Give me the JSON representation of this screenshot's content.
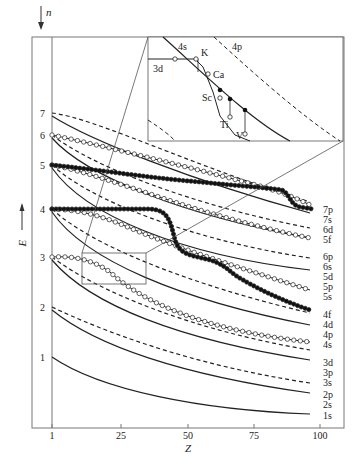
{
  "chart_data": {
    "type": "line",
    "title": "",
    "xlabel": "Z",
    "ylabel": "E",
    "top_axis_label": "n",
    "xlim": [
      1,
      100
    ],
    "x_ticks": [
      1,
      25,
      50,
      75,
      100
    ],
    "x_tick_labels": [
      "1",
      "25",
      "50",
      "75",
      "100"
    ],
    "y_level_labels": [
      "1",
      "2",
      "3",
      "4",
      "5",
      "6",
      "7"
    ],
    "grid": false,
    "legend_position": "right-end labels",
    "series": [
      {
        "name": "1s",
        "style": "solid",
        "x": [
          1,
          25,
          50,
          75,
          100
        ],
        "y": [
          1.0,
          0.62,
          0.42,
          0.3,
          0.24
        ]
      },
      {
        "name": "2s",
        "style": "solid",
        "x": [
          1,
          25,
          50,
          75,
          100
        ],
        "y": [
          2.0,
          1.45,
          1.08,
          0.85,
          0.7
        ]
      },
      {
        "name": "2p",
        "style": "dashed",
        "x": [
          1,
          25,
          50,
          75,
          100
        ],
        "y": [
          2.0,
          1.55,
          1.18,
          0.95,
          0.8
        ]
      },
      {
        "name": "3s",
        "style": "solid",
        "x": [
          1,
          25,
          50,
          75,
          100
        ],
        "y": [
          3.0,
          2.15,
          1.65,
          1.33,
          1.12
        ]
      },
      {
        "name": "3p",
        "style": "dashed",
        "x": [
          1,
          25,
          50,
          75,
          100
        ],
        "y": [
          3.0,
          2.25,
          1.78,
          1.46,
          1.25
        ]
      },
      {
        "name": "3d",
        "style": "open-circles",
        "x": [
          1,
          10,
          20,
          30,
          40,
          50,
          60,
          70,
          80,
          90,
          100
        ],
        "y": [
          3.0,
          3.0,
          2.8,
          2.35,
          2.05,
          1.88,
          1.74,
          1.62,
          1.52,
          1.44,
          1.37
        ]
      },
      {
        "name": "4s",
        "style": "solid",
        "x": [
          1,
          25,
          50,
          75,
          100
        ],
        "y": [
          4.0,
          2.85,
          2.3,
          1.95,
          1.72
        ]
      },
      {
        "name": "4p",
        "style": "dashed",
        "x": [
          1,
          25,
          50,
          75,
          100
        ],
        "y": [
          4.0,
          3.0,
          2.45,
          2.1,
          1.86
        ]
      },
      {
        "name": "4d",
        "style": "open-circles",
        "x": [
          1,
          10,
          25,
          40,
          50,
          60,
          70,
          80,
          90,
          100
        ],
        "y": [
          4.0,
          3.98,
          3.65,
          3.3,
          3.1,
          2.9,
          2.72,
          2.55,
          2.4,
          2.0
        ]
      },
      {
        "name": "4f",
        "style": "filled-circles",
        "x": [
          1,
          20,
          40,
          55,
          57,
          60,
          70,
          80,
          90,
          100
        ],
        "y": [
          4.0,
          4.0,
          4.0,
          3.95,
          3.5,
          3.1,
          2.95,
          2.55,
          2.2,
          1.98
        ]
      },
      {
        "name": "5s",
        "style": "solid",
        "x": [
          1,
          25,
          50,
          75,
          100
        ],
        "y": [
          5.0,
          3.75,
          3.1,
          2.75,
          2.52
        ]
      },
      {
        "name": "5p",
        "style": "dashed",
        "x": [
          1,
          25,
          50,
          75,
          100
        ],
        "y": [
          5.0,
          3.9,
          3.25,
          2.9,
          2.68
        ]
      },
      {
        "name": "5d",
        "style": "open-circles",
        "x": [
          1,
          20,
          40,
          60,
          80,
          100
        ],
        "y": [
          5.0,
          4.6,
          4.1,
          3.6,
          3.25,
          2.78
        ]
      },
      {
        "name": "5f",
        "style": "filled-circles",
        "x": [
          1,
          20,
          40,
          60,
          75,
          85,
          90,
          95,
          100
        ],
        "y": [
          5.0,
          4.9,
          4.7,
          4.45,
          4.3,
          4.15,
          3.7,
          3.35,
          3.3
        ]
      },
      {
        "name": "6s",
        "style": "solid",
        "x": [
          1,
          25,
          50,
          75,
          100
        ],
        "y": [
          6.0,
          4.5,
          3.85,
          3.5,
          3.3
        ]
      },
      {
        "name": "6p",
        "style": "dashed",
        "x": [
          1,
          25,
          50,
          75,
          100
        ],
        "y": [
          6.0,
          4.65,
          4.0,
          3.65,
          3.44
        ]
      },
      {
        "name": "6d",
        "style": "open-circles",
        "x": [
          1,
          20,
          40,
          60,
          80,
          100
        ],
        "y": [
          6.0,
          5.55,
          5.05,
          4.6,
          4.25,
          3.55
        ]
      },
      {
        "name": "7s",
        "style": "solid",
        "x": [
          1,
          25,
          50,
          75,
          100
        ],
        "y": [
          7.0,
          5.5,
          4.8,
          4.3,
          3.8
        ]
      },
      {
        "name": "7p",
        "style": "dashed",
        "x": [
          1,
          25,
          50,
          75,
          100
        ],
        "y": [
          7.0,
          5.7,
          5.0,
          4.45,
          3.95
        ]
      }
    ],
    "right_labels": [
      "7p",
      "7s",
      "6d",
      "5f",
      "6p",
      "6s",
      "5d",
      "5p",
      "5s",
      "4f",
      "4d",
      "4p",
      "4s",
      "3d",
      "3p",
      "3s",
      "2p",
      "2s",
      "1s"
    ],
    "inset": {
      "description": "Magnified region around Z=19-23 showing 3d/4s crossing",
      "curve_labels": [
        "4s",
        "4p",
        "3d"
      ],
      "element_labels": [
        "K",
        "Ca",
        "Sc",
        "Ti",
        "V"
      ]
    }
  }
}
